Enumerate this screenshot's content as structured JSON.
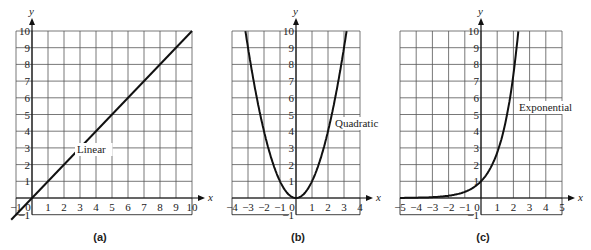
{
  "chart_data": [
    {
      "type": "line",
      "panel_label": "(a)",
      "curve_label": "Linear",
      "function": "y = x",
      "xlabel": "x",
      "ylabel": "y",
      "xlim": [
        -1,
        10
      ],
      "ylim": [
        -1,
        10
      ],
      "x_ticks": [
        "-1",
        "0",
        "1",
        "2",
        "3",
        "4",
        "5",
        "6",
        "7",
        "8",
        "9",
        "10"
      ],
      "y_ticks": [
        "-1",
        "1",
        "2",
        "3",
        "4",
        "5",
        "6",
        "7",
        "8",
        "9",
        "10"
      ],
      "grid": true,
      "x": [
        -1,
        0,
        2,
        4,
        6,
        8,
        10
      ],
      "y": [
        -1,
        0,
        2,
        4,
        6,
        8,
        10
      ]
    },
    {
      "type": "line",
      "panel_label": "(b)",
      "curve_label": "Quadratic",
      "function": "y = x^2",
      "xlabel": "x",
      "ylabel": "y",
      "xlim": [
        -4,
        4
      ],
      "ylim": [
        -1,
        10
      ],
      "x_ticks": [
        "-4",
        "-3",
        "-2",
        "-1",
        "0",
        "1",
        "2",
        "3",
        "4"
      ],
      "y_ticks": [
        "-1",
        "1",
        "2",
        "3",
        "4",
        "5",
        "6",
        "7",
        "8",
        "9",
        "10"
      ],
      "grid": true,
      "x": [
        -3.16,
        -3,
        -2,
        -1,
        0,
        1,
        2,
        3,
        3.16
      ],
      "y": [
        10,
        9,
        4,
        1,
        0,
        1,
        4,
        9,
        10
      ]
    },
    {
      "type": "line",
      "panel_label": "(c)",
      "curve_label": "Exponential",
      "function": "y = e^x",
      "xlabel": "x",
      "ylabel": "y",
      "xlim": [
        -5,
        5
      ],
      "ylim": [
        -1,
        10
      ],
      "x_ticks": [
        "-5",
        "-4",
        "-3",
        "-2",
        "-1",
        "0",
        "1",
        "2",
        "3",
        "4",
        "5"
      ],
      "y_ticks": [
        "-1",
        "1",
        "2",
        "3",
        "4",
        "5",
        "6",
        "7",
        "8",
        "9",
        "10"
      ],
      "grid": true,
      "x": [
        -5,
        -4,
        -3,
        -2,
        -1,
        0,
        1,
        2,
        2.3
      ],
      "y": [
        0.007,
        0.018,
        0.05,
        0.14,
        0.37,
        1,
        2.72,
        7.39,
        10
      ]
    }
  ]
}
